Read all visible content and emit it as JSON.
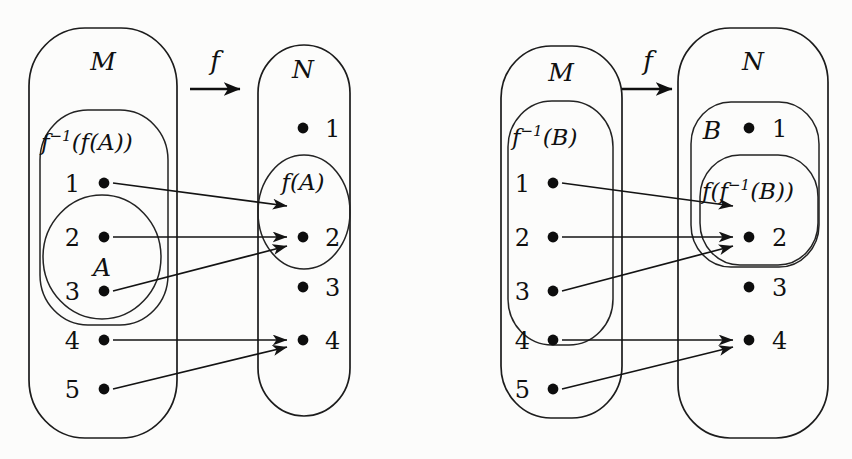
{
  "figure": {
    "background_color": "#fcfcfb",
    "ink_color": "#101010",
    "panels": [
      {
        "id": "left",
        "name": "preimage-of-image",
        "domain_set": {
          "label": "M",
          "elements": [
            "1",
            "2",
            "3",
            "4",
            "5"
          ],
          "subsets": [
            {
              "label_parts": [
                "f",
                "−1",
                "(f(A))"
              ],
              "label_plain": "f⁻¹(f(A))",
              "contains": [
                "1",
                "2",
                "3"
              ]
            },
            {
              "label_parts": [
                "A"
              ],
              "label_plain": "A",
              "contains": [
                "2",
                "3"
              ]
            }
          ]
        },
        "codomain_set": {
          "label": "N",
          "elements": [
            "1",
            "2",
            "3",
            "4"
          ],
          "subsets": [
            {
              "label_parts": [
                "f(A)"
              ],
              "label_plain": "f(A)",
              "contains": [
                "2"
              ]
            }
          ]
        },
        "map_label": "f",
        "mappings": [
          {
            "from": "1",
            "to": "2"
          },
          {
            "from": "2",
            "to": "2"
          },
          {
            "from": "3",
            "to": "2"
          },
          {
            "from": "4",
            "to": "4"
          },
          {
            "from": "5",
            "to": "4"
          }
        ]
      },
      {
        "id": "right",
        "name": "image-of-preimage",
        "domain_set": {
          "label": "M",
          "elements": [
            "1",
            "2",
            "3",
            "4",
            "5"
          ],
          "subsets": [
            {
              "label_parts": [
                "f",
                "−1",
                "(B)"
              ],
              "label_plain": "f⁻¹(B)",
              "contains": [
                "1",
                "2",
                "3"
              ]
            }
          ]
        },
        "codomain_set": {
          "label": "N",
          "elements": [
            "1",
            "2",
            "3",
            "4"
          ],
          "subsets": [
            {
              "label_parts": [
                "B"
              ],
              "label_plain": "B",
              "contains": [
                "1",
                "2"
              ]
            },
            {
              "label_parts": [
                "f(f",
                "−1",
                "(B))"
              ],
              "label_plain": "f(f⁻¹(B))",
              "contains": [
                "2"
              ]
            }
          ]
        },
        "map_label": "f",
        "mappings": [
          {
            "from": "1",
            "to": "2"
          },
          {
            "from": "2",
            "to": "2"
          },
          {
            "from": "3",
            "to": "2"
          },
          {
            "from": "4",
            "to": "4"
          },
          {
            "from": "5",
            "to": "4"
          }
        ]
      }
    ]
  },
  "labels": {
    "M": "M",
    "N": "N",
    "A": "A",
    "B": "B",
    "f": "f",
    "one": "1",
    "two": "2",
    "three": "3",
    "four": "4",
    "five": "5",
    "inv_exp": "−1",
    "f_open": "f",
    "finv_fA_tail": "(f(A))",
    "finv_B_tail": "(B)",
    "fA": "f(A)",
    "ffinvB_head": "f(f",
    "ffinvB_tail": "(B))"
  }
}
